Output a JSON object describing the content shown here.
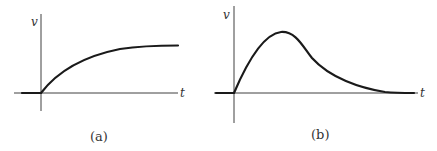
{
  "figures": [
    {
      "id": "a",
      "caption": "(a)",
      "y_axis_label": "v",
      "x_axis_label": "t",
      "description": "exponential rise to a plateau starting at t = 0"
    },
    {
      "id": "b",
      "caption": "(b)",
      "y_axis_label": "v",
      "x_axis_label": "t",
      "description": "rise to a single peak then decay back toward zero"
    }
  ]
}
